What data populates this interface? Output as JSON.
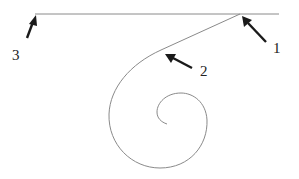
{
  "diagram": {
    "type": "line-and-spiral illustration",
    "colors": {
      "line": "#8a8a8a",
      "arrow": "#1a1a1a",
      "label": "#222222",
      "background": "#ffffff"
    },
    "labels": [
      {
        "id": "1",
        "text": "1"
      },
      {
        "id": "2",
        "text": "2"
      },
      {
        "id": "3",
        "text": "3"
      }
    ],
    "shapes": {
      "horizontal_line": "straight horizontal line across top",
      "tangent_segment": "straight segment leaving horizontal line at point 1, descending to point 2",
      "spiral": "inward spiral starting at point 2"
    }
  }
}
